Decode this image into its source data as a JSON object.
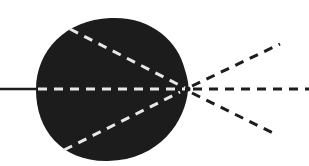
{
  "diagram": {
    "colors": {
      "background": "#ffffff",
      "body": "#1c1c1c",
      "inner_rays": "#e8e8e8",
      "outer_rays": "#1c1c1c"
    },
    "elements": {
      "body": "dark-body",
      "incoming_ray": "incoming-solid-ray",
      "inner_rays": [
        "inner-upper-ray",
        "inner-center-ray",
        "inner-lower-ray"
      ],
      "outer_rays": [
        "outer-upper-ray",
        "outer-center-ray",
        "outer-lower-ray"
      ],
      "focal_point": "focal-point"
    }
  }
}
